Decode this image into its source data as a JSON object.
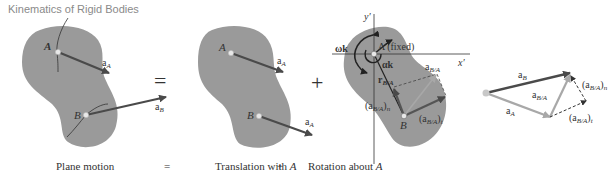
{
  "header": {
    "title": "Kinematics of Rigid Bodies"
  },
  "colors": {
    "body_fill": "#9a9a9a",
    "arrow_dark": "#4a4a4a",
    "arrow_light": "#a8a8a8",
    "text": "#333333",
    "title": "#8a8a8a"
  },
  "panels": {
    "plane_motion": {
      "point_a": "A",
      "point_b": "B",
      "accel_a": "a",
      "accel_a_sub": "A",
      "accel_b": "a",
      "accel_b_sub": "B"
    },
    "equals_sign": "=",
    "translation": {
      "point_a": "A",
      "point_b": "B",
      "accel_a_top": "a",
      "accel_a_top_sub": "A",
      "accel_a_bottom": "a",
      "accel_a_bottom_sub": "A"
    },
    "plus_sign": "+",
    "rotation": {
      "axis_y": "y′",
      "axis_x": "x′",
      "omega_k": "ωk",
      "alpha_k": "αk",
      "point_a_fixed": "A (fixed)",
      "point_b": "B",
      "r_ba": "r",
      "r_ba_sub": "B/A",
      "a_ba": "a",
      "a_ba_sub": "B/A",
      "a_ba_n": "(a",
      "a_ba_n_sub": "B/A",
      "a_ba_n_tail": ")",
      "a_ba_n_subscript": "n",
      "a_ba_t": "(a",
      "a_ba_t_sub": "B/A",
      "a_ba_t_tail": ")",
      "a_ba_t_subscript": "t"
    },
    "vector_diagram": {
      "a_b": "a",
      "a_b_sub": "B",
      "a_a": "a",
      "a_a_sub": "A",
      "a_ba": "a",
      "a_ba_sub": "B/A",
      "a_ba_n": "(a",
      "a_ba_n_sub": "B/A",
      "a_ba_n_tail": ")",
      "a_ba_n_subscript": "n",
      "a_ba_t": "(a",
      "a_ba_t_sub": "B/A",
      "a_ba_t_tail": ")",
      "a_ba_t_subscript": "t"
    }
  },
  "captions": {
    "plane_motion": "Plane motion",
    "equals": "=",
    "translation": "Translation with ",
    "translation_point": "A",
    "plus": "+",
    "rotation": "Rotation about ",
    "rotation_point": "A"
  }
}
